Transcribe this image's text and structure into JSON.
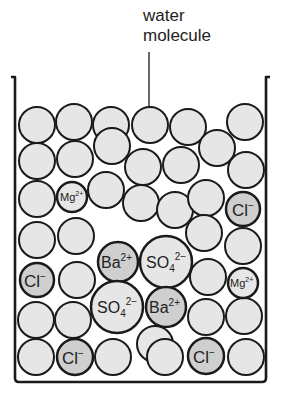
{
  "diagram": {
    "title_label": {
      "line1": "water",
      "line2": "molecule"
    },
    "colors": {
      "water_fill": "#e6e6e6",
      "ion_fill": "#cfcfcf",
      "stroke": "#1a1a1a",
      "background": "#ffffff"
    },
    "container": {
      "type": "beaker",
      "open_top": true
    },
    "water_molecules_count": 33,
    "ions": [
      {
        "id": "mg1",
        "label": "Mg",
        "charge": "2+",
        "count_in_view": 1
      },
      {
        "id": "mg2",
        "label": "Mg",
        "charge": "2+"
      },
      {
        "id": "cl1",
        "label": "Cl",
        "charge": "−"
      },
      {
        "id": "cl2",
        "label": "Cl",
        "charge": "−"
      },
      {
        "id": "cl3",
        "label": "Cl",
        "charge": "−"
      },
      {
        "id": "cl4",
        "label": "Cl",
        "charge": "−"
      },
      {
        "id": "ba1",
        "label": "Ba",
        "charge": "2+"
      },
      {
        "id": "ba2",
        "label": "Ba",
        "charge": "2+"
      },
      {
        "id": "so4a",
        "label": "SO",
        "subscript": "4",
        "charge": "2−"
      },
      {
        "id": "so4b",
        "label": "SO",
        "subscript": "4",
        "charge": "2−"
      }
    ]
  }
}
